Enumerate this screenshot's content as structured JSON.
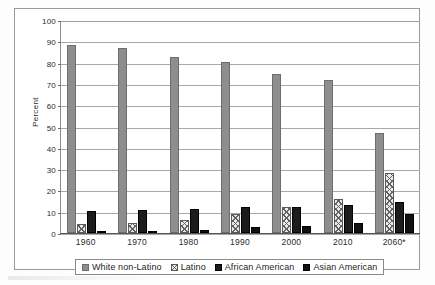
{
  "chart_data": {
    "type": "bar",
    "title": "",
    "xlabel": "",
    "ylabel": "Percent",
    "ylim": [
      0,
      100
    ],
    "ytick_step": 10,
    "yticks": [
      0,
      10,
      20,
      30,
      40,
      50,
      60,
      70,
      80,
      90,
      100
    ],
    "grid": true,
    "legend_position": "bottom",
    "categories": [
      "1960",
      "1970",
      "1980",
      "1990",
      "2000",
      "2010",
      "2060*"
    ],
    "series": [
      {
        "name": "White non-Latino",
        "style": "solid-gray",
        "color": "#8e8e8e",
        "values": [
          88.5,
          87.0,
          82.5,
          80.3,
          74.5,
          72.0,
          47.0
        ]
      },
      {
        "name": "Latino",
        "style": "crosshatch",
        "color": "#e9e9e9",
        "values": [
          4.0,
          4.5,
          6.0,
          9.0,
          12.0,
          16.0,
          28.0
        ]
      },
      {
        "name": "African American",
        "style": "solid-black",
        "color": "#1c1c1c",
        "values": [
          10.5,
          11.0,
          11.5,
          12.0,
          12.0,
          13.0,
          14.5
        ]
      },
      {
        "name": "Asian American",
        "style": "solid-black",
        "color": "#111111",
        "values": [
          0.5,
          0.8,
          1.5,
          2.8,
          3.5,
          4.8,
          9.0
        ]
      }
    ]
  }
}
